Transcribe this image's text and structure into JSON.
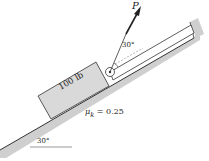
{
  "diagram": {
    "type": "inclined-plane-free-body",
    "block": {
      "label": "100 lb"
    },
    "force": {
      "label": "P",
      "angle_label": "30°"
    },
    "friction": {
      "symbol": "μ",
      "subscript": "k",
      "equals": " = 0.25",
      "text": "μk = 0.25"
    },
    "incline": {
      "angle_label": "30°"
    },
    "colors": {
      "block_fill": "#d9d9d9",
      "incline_fill": "#cfcfcf",
      "stroke": "#333333",
      "background": "#ffffff"
    }
  }
}
